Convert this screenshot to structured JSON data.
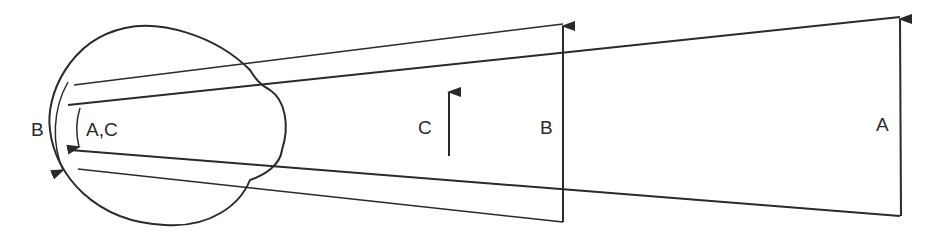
{
  "diagram": {
    "title": "",
    "labels": {
      "eye_outer_arc": "B",
      "eye_inner_arc": "A,C",
      "object_c": "C",
      "object_b": "B",
      "object_a": "A"
    },
    "colors": {
      "stroke": "#2a2a2a",
      "background": "#ffffff"
    }
  }
}
